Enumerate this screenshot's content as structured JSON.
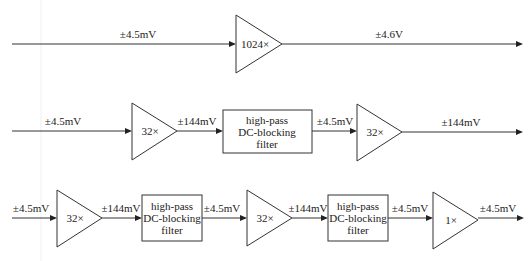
{
  "diagram": {
    "type": "signal-chain-block-diagram",
    "rows": [
      {
        "id": "row1",
        "input_label": "±4.5mV",
        "stages": [
          {
            "kind": "amplifier",
            "gain": "1024×"
          }
        ],
        "output_label": "±4.6V"
      },
      {
        "id": "row2",
        "input_label": "±4.5mV",
        "stages": [
          {
            "kind": "amplifier",
            "gain": "32×",
            "output_label": "±144mV"
          },
          {
            "kind": "filter",
            "lines": [
              "high-pass",
              "DC-blocking",
              "filter"
            ],
            "output_label": "±4.5mV"
          },
          {
            "kind": "amplifier",
            "gain": "32×"
          }
        ],
        "output_label": "±144mV"
      },
      {
        "id": "row3",
        "input_label": "±4.5mV",
        "stages": [
          {
            "kind": "amplifier",
            "gain": "32×",
            "output_label": "±144mV"
          },
          {
            "kind": "filter",
            "lines": [
              "high-pass",
              "DC-blocking",
              "filter"
            ],
            "output_label": "±4.5mV"
          },
          {
            "kind": "amplifier",
            "gain": "32×",
            "output_label": "±144mV"
          },
          {
            "kind": "filter",
            "lines": [
              "high-pass",
              "DC-blocking",
              "filter"
            ],
            "output_label": "±4.5mV"
          },
          {
            "kind": "amplifier",
            "gain": "1×"
          }
        ],
        "output_label": "±4.5mV"
      }
    ]
  }
}
